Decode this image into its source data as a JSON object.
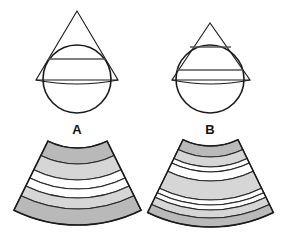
{
  "colors": {
    "stroke": "#1a1a1a",
    "band_dark": "#b9b9b9",
    "band_light": "#d6d6d6",
    "band_white": "#ffffff",
    "background": "#ffffff"
  },
  "panels": [
    {
      "label": "A",
      "label_pos": [
        77,
        123
      ],
      "cone_circle": {
        "triangle": [
          [
            77,
            11
          ],
          [
            36,
            80
          ],
          [
            118,
            80
          ]
        ],
        "circle": {
          "cx": 77,
          "cy": 79,
          "r": 34
        },
        "chords": [
          {
            "y": 59,
            "x1": 48,
            "x2": 106
          }
        ],
        "base_arc": {
          "x1": 36,
          "x2": 118,
          "y": 80,
          "sag": 4
        }
      },
      "fan": {
        "cx": 77.5,
        "cy": 81,
        "half_angle_deg": 26.2,
        "bands": [
          {
            "r0": 67,
            "r1": 83,
            "tone": "band_dark"
          },
          {
            "r0": 83,
            "r1": 99,
            "tone": "band_light"
          },
          {
            "r0": 99,
            "r1": 108,
            "tone": "band_white"
          },
          {
            "r0": 108,
            "r1": 117,
            "tone": "band_white"
          },
          {
            "r0": 117,
            "r1": 128,
            "tone": "band_light"
          },
          {
            "r0": 128,
            "r1": 144,
            "tone": "band_dark"
          }
        ]
      }
    },
    {
      "label": "B",
      "label_pos": [
        210,
        123
      ],
      "cone_circle": {
        "triangle": [
          [
            210,
            23
          ],
          [
            172,
            80
          ],
          [
            250,
            80
          ]
        ],
        "circle": {
          "cx": 210,
          "cy": 79,
          "r": 34
        },
        "chords": [
          {
            "y": 47,
            "x1": 190,
            "x2": 231
          },
          {
            "y": 70,
            "x1": 177,
            "x2": 243
          }
        ],
        "base_arc": {
          "x1": 172,
          "x2": 250,
          "y": 80,
          "sag": 4
        }
      },
      "fan": {
        "cx": 210.5,
        "cy": 83,
        "half_angle_deg": 25.9,
        "bands": [
          {
            "r0": 63,
            "r1": 74,
            "tone": "band_dark"
          },
          {
            "r0": 74,
            "r1": 84,
            "tone": "band_light"
          },
          {
            "r0": 84,
            "r1": 89,
            "tone": "band_white"
          },
          {
            "r0": 89,
            "r1": 98,
            "tone": "band_white"
          },
          {
            "r0": 98,
            "r1": 117,
            "tone": "band_light"
          },
          {
            "r0": 117,
            "r1": 122,
            "tone": "band_white"
          },
          {
            "r0": 122,
            "r1": 127,
            "tone": "band_white"
          },
          {
            "r0": 127,
            "r1": 135,
            "tone": "band_light"
          },
          {
            "r0": 135,
            "r1": 144,
            "tone": "band_dark"
          }
        ]
      }
    }
  ]
}
